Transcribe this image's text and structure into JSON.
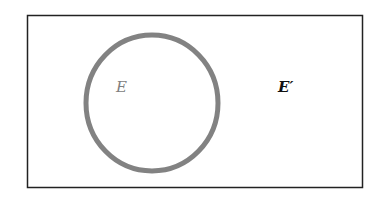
{
  "diagram": {
    "type": "venn",
    "universe": {
      "x": 27,
      "y": 15,
      "width": 336,
      "height": 173,
      "stroke": "#222222"
    },
    "set": {
      "cx": 152,
      "cy": 103,
      "rx": 66,
      "ry": 68,
      "stroke": "#808080"
    },
    "labels": {
      "set_label": "E",
      "complement_label": "E′"
    },
    "colors": {
      "set_label": "#808080",
      "complement_label": "#111111"
    }
  }
}
